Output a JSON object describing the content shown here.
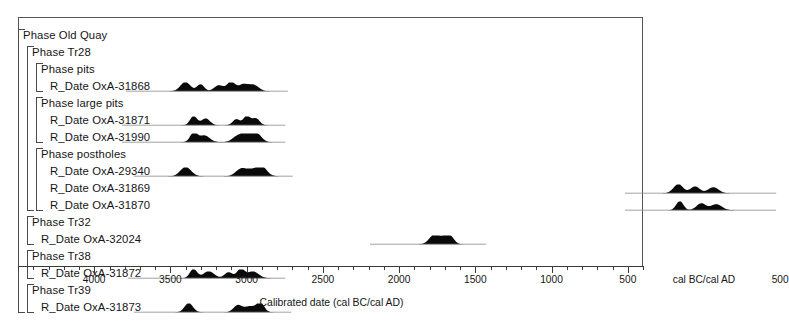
{
  "chart_data": {
    "type": "table",
    "title": "",
    "xlabel": "Calibrated date (cal BC/cal AD)",
    "ylabel": "",
    "xlim": [
      4500,
      400
    ],
    "axis_direction": "descending BC then ascending AD",
    "grid": false,
    "legend": "none",
    "tick_labels": [
      "4000",
      "3500",
      "3000",
      "2500",
      "2000",
      "1500",
      "1000",
      "500",
      "cal BC/cal AD",
      "500"
    ],
    "tick_values": [
      4000,
      3500,
      3000,
      2500,
      2000,
      1500,
      1000,
      500,
      0,
      -500
    ],
    "minor_tick_step": 100,
    "rows": [
      {
        "label": "Phase Old Quay",
        "kind": "phase",
        "depth": 0,
        "dist": null
      },
      {
        "label": "Phase Tr28",
        "kind": "phase",
        "depth": 1,
        "dist": null
      },
      {
        "label": "Phase pits",
        "kind": "phase",
        "depth": 2,
        "dist": null
      },
      {
        "label": "R_Date OxA-31868",
        "kind": "date",
        "depth": 3,
        "dist": {
          "start": 3750,
          "end": 2780,
          "peaks": [
            3400,
            3300,
            3180,
            3100,
            3020,
            2950
          ]
        }
      },
      {
        "label": "Phase large pits",
        "kind": "phase",
        "depth": 2,
        "dist": null
      },
      {
        "label": "R_Date OxA-31871",
        "kind": "date",
        "depth": 3,
        "dist": {
          "start": 3780,
          "end": 2800,
          "peaks": [
            3350,
            3270,
            3070,
            3000,
            2940
          ]
        }
      },
      {
        "label": "R_Date OxA-31990",
        "kind": "date",
        "depth": 3,
        "dist": {
          "start": 3780,
          "end": 2800,
          "peaks": [
            3350,
            3280,
            3060,
            2990,
            2930
          ]
        }
      },
      {
        "label": "Phase postholes",
        "kind": "phase",
        "depth": 2,
        "dist": null
      },
      {
        "label": "R_Date OxA-29340",
        "kind": "date",
        "depth": 3,
        "dist": {
          "start": 3700,
          "end": 2750,
          "peaks": [
            3400,
            3040,
            2970,
            2900
          ]
        }
      },
      {
        "label": "R_Date OxA-31869",
        "kind": "date",
        "depth": 3,
        "dist": {
          "start": 480,
          "end": -420,
          "peaks": [
            170,
            60,
            -60
          ]
        }
      },
      {
        "label": "R_Date OxA-31870",
        "kind": "date",
        "depth": 3,
        "dist": {
          "start": 480,
          "end": -420,
          "peaks": [
            160,
            20,
            -80
          ]
        }
      },
      {
        "label": "Phase Tr32",
        "kind": "phase",
        "depth": 1,
        "dist": null
      },
      {
        "label": "R_Date OxA-32024",
        "kind": "date",
        "depth": 2,
        "dist": {
          "start": 2150,
          "end": 1480,
          "peaks": [
            1770,
            1700,
            1660
          ]
        }
      },
      {
        "label": "Phase Tr38",
        "kind": "phase",
        "depth": 1,
        "dist": null
      },
      {
        "label": "R_Date OxA-31872",
        "kind": "date",
        "depth": 2,
        "dist": {
          "start": 3740,
          "end": 2800,
          "peaks": [
            3350,
            3250,
            3120,
            3040,
            2960
          ]
        }
      },
      {
        "label": "Phase Tr39",
        "kind": "phase",
        "depth": 1,
        "dist": null
      },
      {
        "label": "R_Date OxA-31873",
        "kind": "date",
        "depth": 2,
        "dist": {
          "start": 3700,
          "end": 2760,
          "peaks": [
            3380,
            3060,
            2980,
            2910
          ]
        }
      }
    ]
  },
  "axis": {
    "title": "Calibrated date (cal BC/cal AD)"
  },
  "colors": {
    "frame": "#555555",
    "bracket": "#4a4a4a",
    "distribution": "#0a0a0a",
    "text": "#151515",
    "background": "#ffffff"
  }
}
